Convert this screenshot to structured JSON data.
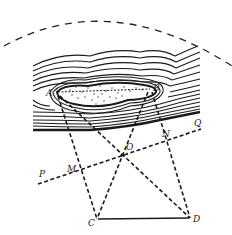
{
  "figure": {
    "colors": {
      "ink": "#1a1a1a",
      "background": "#ffffff"
    },
    "points": {
      "A": {
        "label": "A",
        "x": 55,
        "y": 93
      },
      "B": {
        "label": "B",
        "x": 153,
        "y": 88
      },
      "C": {
        "label": "C",
        "x": 97,
        "y": 219
      },
      "D": {
        "label": "D",
        "x": 190,
        "y": 218
      },
      "O": {
        "label": "O",
        "x": 122,
        "y": 155
      },
      "M": {
        "label": "M",
        "x": 80,
        "y": 171
      },
      "N": {
        "label": "N",
        "x": 163,
        "y": 140
      },
      "P": {
        "label": "P",
        "x": 40,
        "y": 173
      },
      "Q": {
        "label": "Q",
        "x": 197,
        "y": 124
      }
    },
    "lines": [
      {
        "from": "A",
        "to": "C",
        "style": "dashed"
      },
      {
        "from": "B",
        "to": "D",
        "style": "dashed"
      },
      {
        "from": "A",
        "to": "D",
        "style": "dashed"
      },
      {
        "from": "B",
        "to": "C",
        "style": "dashed"
      },
      {
        "from": "P",
        "to": "Q",
        "style": "dashed"
      },
      {
        "from": "C",
        "to": "D",
        "style": "solid"
      }
    ],
    "features": {
      "hill": "contour lines with dotted summit region between A and B",
      "arc": "dashed circular arc above the hill"
    }
  }
}
